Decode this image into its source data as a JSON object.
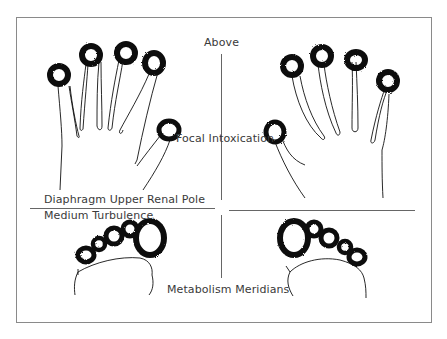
{
  "diagram": {
    "labels": {
      "top": "Above",
      "center": "Focal Intoxication",
      "left_middle_upper": "Diaphragm Upper Renal Pole",
      "left_middle_lower": "Medium Turbulence",
      "bottom": "Metabolism Meridians"
    },
    "panels": [
      {
        "id": "left-hand",
        "description": "Left hand, fingertips marked with dark rough circles"
      },
      {
        "id": "right-hand",
        "description": "Right hand, fingertips marked with dark rough circles"
      },
      {
        "id": "left-foot",
        "description": "Left foot toes marked with dark rough circles"
      },
      {
        "id": "right-foot",
        "description": "Right foot toes marked with dark rough circles"
      }
    ],
    "colors": {
      "ink": "#111111",
      "frame": "#8a8a8a",
      "divider": "#555555",
      "text": "#3a3a3a"
    }
  }
}
